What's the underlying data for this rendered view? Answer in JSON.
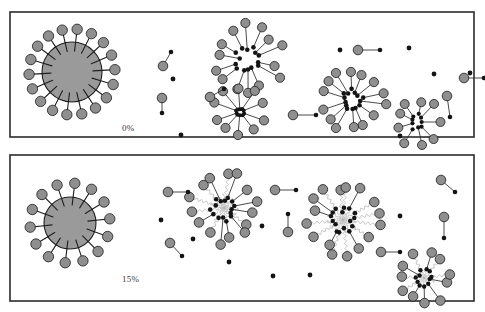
{
  "figure": {
    "background_color": "#ffffff",
    "node_color": "#8f8f8f",
    "dot_color": "#141414",
    "edge_color": "#2b2b2b",
    "squiggle_color": "#b6b6b6",
    "border_color": "#2b2b2b",
    "hub_fill_color": "#9a9a9a"
  },
  "panels": [
    {
      "id": "panel-top",
      "label": "0%",
      "label_x": 122,
      "label_y": 131,
      "frame": {
        "x": 10,
        "y": 12,
        "w": 464,
        "h": 125
      },
      "hub": {
        "cx": 72,
        "cy": 72,
        "r": 30,
        "spoke_count": 18,
        "spoke_len": 13,
        "node_r": 5.2,
        "inner_tick": 9
      },
      "clusters": [
        {
          "name": "cluster-a",
          "cx": 248,
          "cy": 60,
          "edge_style": "straight",
          "outer_r": 34,
          "inner_r": 13,
          "count": 14,
          "node_r": 4.6,
          "dot_r": 2.3,
          "rot": 8
        },
        {
          "name": "cluster-b",
          "cx": 240,
          "cy": 112,
          "edge_style": "straight",
          "outer_r": 25,
          "inner_r": 4,
          "count": 10,
          "node_r": 4.6,
          "dot_r": 2.0,
          "rot": 20
        },
        {
          "name": "cluster-c",
          "cx": 352,
          "cy": 100,
          "edge_style": "straight",
          "outer_r": 33,
          "inner_r": 12,
          "count": 14,
          "node_r": 4.6,
          "dot_r": 2.3,
          "rot": 14
        },
        {
          "name": "cluster-d",
          "cx": 417,
          "cy": 122,
          "edge_style": "straight",
          "outer_r": 23,
          "inner_r": 8,
          "count": 9,
          "node_r": 4.5,
          "dot_r": 2.1,
          "rot": 0
        }
      ],
      "pairs": [
        {
          "name": "pair-1",
          "nx": 163,
          "ny": 66,
          "dx": 171,
          "dy": 52
        },
        {
          "name": "pair-2",
          "nx": 162,
          "ny": 98,
          "dx": 162,
          "dy": 113
        },
        {
          "name": "pair-3",
          "nx": 210,
          "ny": 97,
          "dx": 224,
          "dy": 89
        },
        {
          "name": "pair-4",
          "nx": 293,
          "ny": 115,
          "dx": 316,
          "dy": 115
        },
        {
          "name": "pair-5",
          "nx": 358,
          "ny": 50,
          "dx": 380,
          "dy": 50
        },
        {
          "name": "pair-6",
          "nx": 464,
          "ny": 78,
          "dx": 484,
          "dy": 78
        },
        {
          "name": "pair-7",
          "nx": 447,
          "ny": 96,
          "dx": 450,
          "dy": 117
        }
      ],
      "lone_nodes": [],
      "lone_dots": [
        {
          "name": "dot-1",
          "x": 173,
          "y": 79
        },
        {
          "name": "dot-2",
          "x": 181,
          "y": 135
        },
        {
          "name": "dot-3",
          "x": 340,
          "y": 50
        },
        {
          "name": "dot-4",
          "x": 409,
          "y": 48
        },
        {
          "name": "dot-5",
          "x": 434,
          "y": 74
        },
        {
          "name": "dot-6",
          "x": 470,
          "y": 73
        },
        {
          "name": "dot-7",
          "x": 400,
          "y": 136
        }
      ]
    },
    {
      "id": "panel-bottom",
      "label": "15%",
      "label_x": 122,
      "label_y": 282,
      "frame": {
        "x": 10,
        "y": 155,
        "w": 464,
        "h": 146
      },
      "hub": {
        "cx": 70,
        "cy": 223,
        "r": 26,
        "spoke_count": 14,
        "spoke_len": 14,
        "node_r": 5.2,
        "inner_tick": 8
      },
      "clusters": [
        {
          "name": "cluster-e",
          "cx": 224,
          "cy": 208,
          "edge_style": "wavy",
          "outer_r": 34,
          "inner_r": 13,
          "count": 15,
          "node_r": 4.8,
          "dot_r": 2.3,
          "rot": 6
        },
        {
          "name": "cluster-f",
          "cx": 343,
          "cy": 220,
          "edge_style": "wavy",
          "outer_r": 35,
          "inner_r": 13,
          "count": 16,
          "node_r": 4.8,
          "dot_r": 2.3,
          "rot": 12
        },
        {
          "name": "cluster-g",
          "cx": 424,
          "cy": 278,
          "edge_style": "wavy",
          "outer_r": 26,
          "inner_r": 9,
          "count": 11,
          "node_r": 4.8,
          "dot_r": 2.2,
          "rot": 18
        }
      ],
      "pairs": [
        {
          "name": "pair-8",
          "nx": 168,
          "ny": 192,
          "dx": 188,
          "dy": 192
        },
        {
          "name": "pair-9",
          "nx": 170,
          "ny": 243,
          "dx": 182,
          "dy": 256
        },
        {
          "name": "pair-10",
          "nx": 275,
          "ny": 190,
          "dx": 296,
          "dy": 190
        },
        {
          "name": "pair-11",
          "nx": 288,
          "ny": 232,
          "dx": 288,
          "dy": 214
        },
        {
          "name": "pair-12",
          "nx": 441,
          "ny": 180,
          "dx": 455,
          "dy": 192
        },
        {
          "name": "pair-13",
          "nx": 444,
          "ny": 217,
          "dx": 444,
          "dy": 238
        },
        {
          "name": "pair-14",
          "nx": 381,
          "ny": 252,
          "dx": 400,
          "dy": 252
        }
      ],
      "lone_nodes": [],
      "lone_dots": [
        {
          "name": "dot-8",
          "x": 161,
          "y": 220
        },
        {
          "name": "dot-9",
          "x": 193,
          "y": 239
        },
        {
          "name": "dot-10",
          "x": 229,
          "y": 262
        },
        {
          "name": "dot-11",
          "x": 262,
          "y": 226
        },
        {
          "name": "dot-12",
          "x": 273,
          "y": 276
        },
        {
          "name": "dot-13",
          "x": 310,
          "y": 275
        },
        {
          "name": "dot-14",
          "x": 400,
          "y": 216
        }
      ]
    }
  ]
}
